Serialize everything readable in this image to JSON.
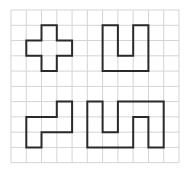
{
  "grid": {
    "cols": 11,
    "rows": 10,
    "origin_x": 11,
    "origin_y": 10,
    "cell": 15.27,
    "line_color": "#d4d4d4",
    "shape_color": "#2a2a2a"
  },
  "shapes": [
    {
      "name": "cross-shape",
      "points": [
        [
          2,
          1
        ],
        [
          3,
          1
        ],
        [
          3,
          2
        ],
        [
          4,
          2
        ],
        [
          4,
          3
        ],
        [
          3,
          3
        ],
        [
          3,
          4
        ],
        [
          2,
          4
        ],
        [
          2,
          3
        ],
        [
          1,
          3
        ],
        [
          1,
          2
        ],
        [
          2,
          2
        ]
      ]
    },
    {
      "name": "u-shape",
      "points": [
        [
          6,
          1
        ],
        [
          7,
          1
        ],
        [
          7,
          3
        ],
        [
          8,
          3
        ],
        [
          8,
          1
        ],
        [
          9,
          1
        ],
        [
          9,
          4
        ],
        [
          6,
          4
        ]
      ]
    },
    {
      "name": "step-shape",
      "points": [
        [
          3,
          6
        ],
        [
          4,
          6
        ],
        [
          4,
          8
        ],
        [
          2,
          8
        ],
        [
          2,
          9
        ],
        [
          1,
          9
        ],
        [
          1,
          7
        ],
        [
          3,
          7
        ]
      ]
    },
    {
      "name": "serpentine-shape",
      "points": [
        [
          5,
          6
        ],
        [
          6,
          6
        ],
        [
          6,
          8
        ],
        [
          7,
          8
        ],
        [
          7,
          6
        ],
        [
          10,
          6
        ],
        [
          10,
          9
        ],
        [
          9,
          9
        ],
        [
          9,
          7
        ],
        [
          8,
          7
        ],
        [
          8,
          9
        ],
        [
          5,
          9
        ]
      ]
    }
  ]
}
